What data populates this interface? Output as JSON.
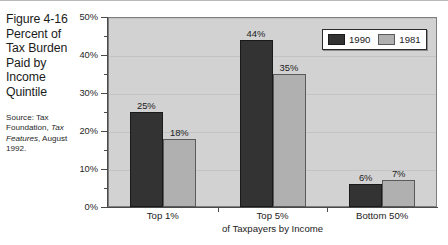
{
  "caption": {
    "title_lines": [
      "Figure 4-16",
      "Percent of",
      "Tax Burden",
      "Paid by",
      "Income",
      "Quintile"
    ],
    "source_prefix": "Source: Tax Foundation, ",
    "source_italic": "Tax Features",
    "source_suffix": ", August 1992."
  },
  "legend": {
    "items": [
      {
        "label": "1990",
        "color": "#333333"
      },
      {
        "label": "1981",
        "color": "#b0b0b0"
      }
    ]
  },
  "chart_data": {
    "type": "bar",
    "categories": [
      "Top 1%",
      "Top 5%",
      "Bottom 50%"
    ],
    "series": [
      {
        "name": "1990",
        "values": [
          25,
          44,
          6
        ],
        "labels": [
          "25%",
          "44%",
          "6%"
        ],
        "color": "#333333"
      },
      {
        "name": "1981",
        "values": [
          18,
          35,
          7
        ],
        "labels": [
          "18%",
          "35%",
          "7%"
        ],
        "color": "#b0b0b0"
      }
    ],
    "xlabel": "of Taxpayers by Income",
    "ylabel": "",
    "ylim": [
      0,
      50
    ],
    "ytick_values": [
      0,
      10,
      20,
      30,
      40,
      50
    ],
    "ytick_labels": [
      "0%",
      "10%",
      "20%",
      "30%",
      "40%",
      "50%"
    ],
    "yminor_values": [
      5,
      15,
      25,
      35,
      45
    ],
    "grid": true,
    "legend_position": "top-right",
    "plot_background": "#d2d2d2"
  }
}
